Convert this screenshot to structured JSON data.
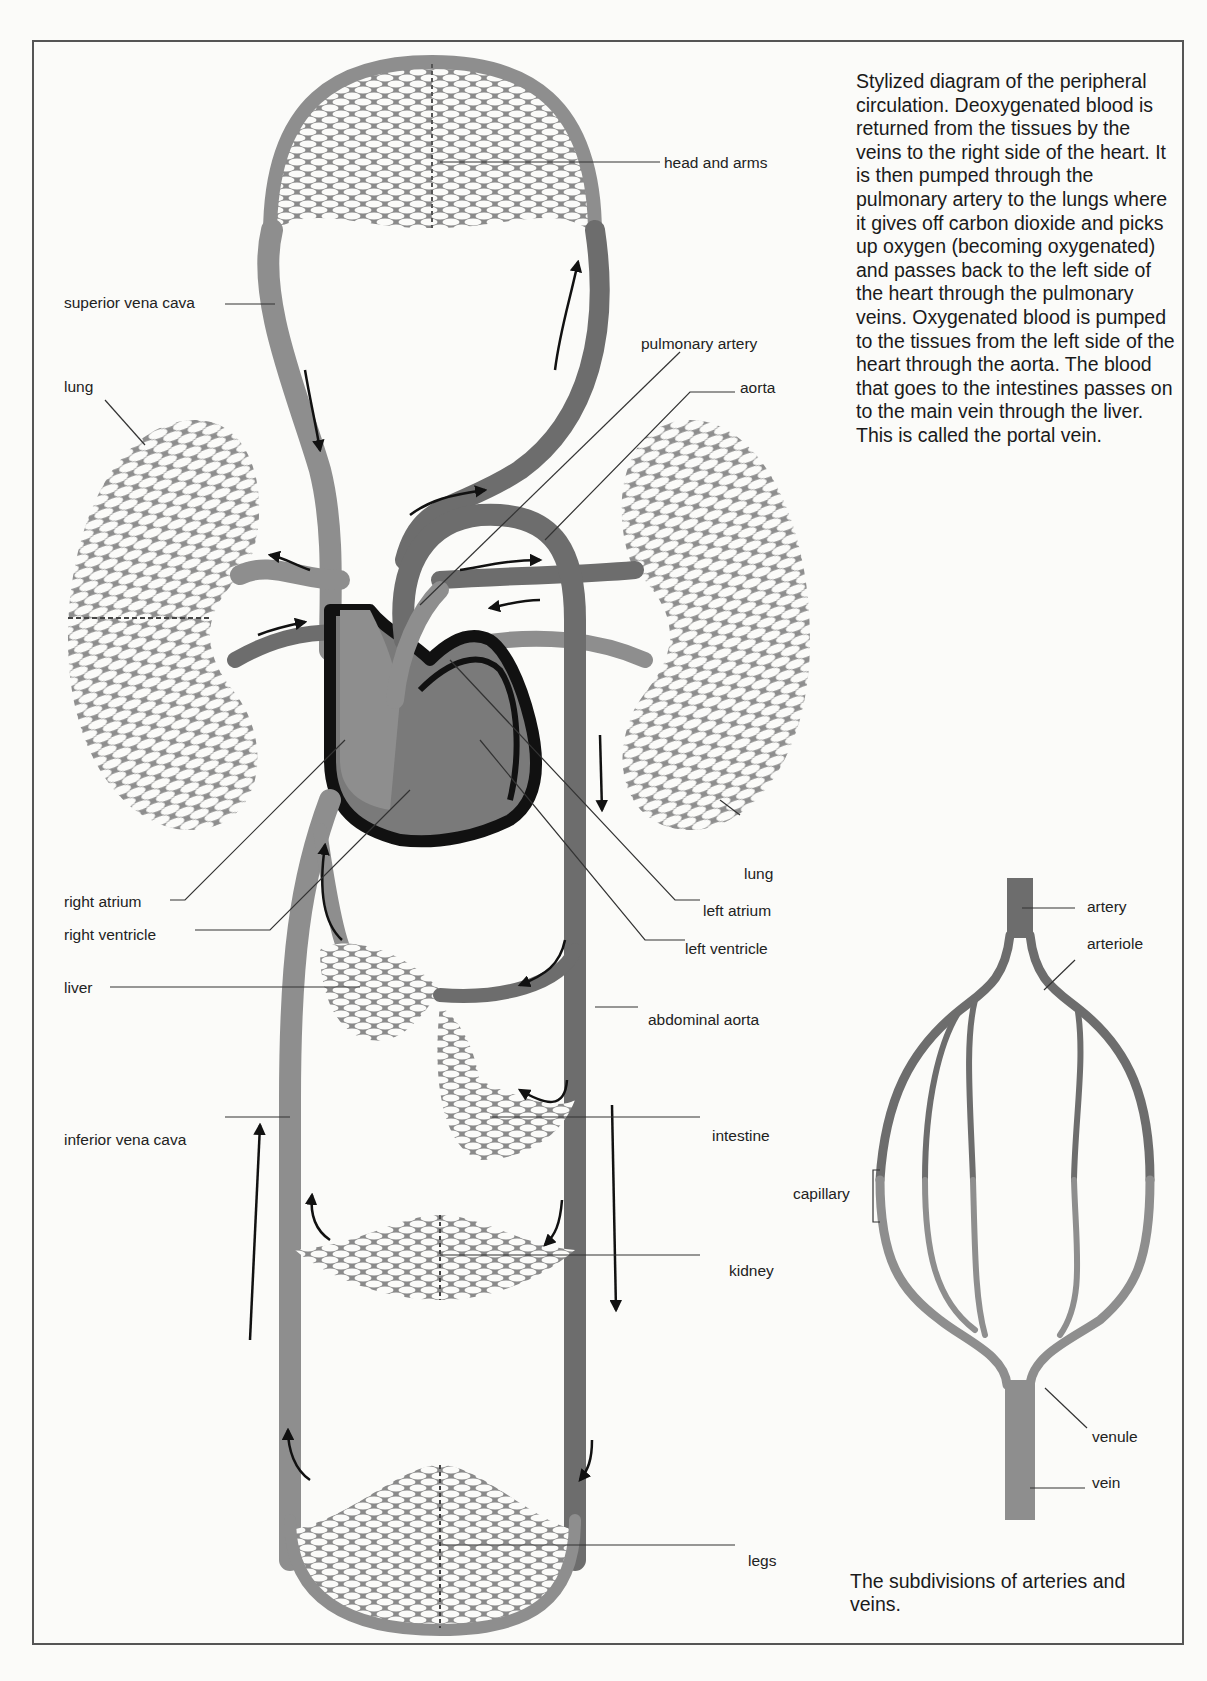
{
  "figure": {
    "title_caption": "Stylized diagram of the peripheral circulation. Deoxygenated blood is returned from the tissues by the veins to the right side of the heart. It is then pumped through the pulmonary artery to the lungs where it gives off carbon dioxide and picks up oxygen (becoming oxygenated) and passes back to the left side of the heart through the pulmonary veins. Oxygenated blood is pumped to the tissues from the left side of the heart through the aorta. The blood that goes to the intestines passes on to the main vein through the liver. This is called the portal vein.",
    "subdivision_caption": "The subdivisions of arteries and veins.",
    "colors": {
      "vein_gray": "#8e8e8e",
      "artery_gray": "#6d6d6d",
      "heart_outline": "#111111",
      "frame": "#555555",
      "background": "#fbfbf9"
    }
  },
  "circulation_labels": {
    "head_and_arms": "head and arms",
    "superior_vena_cava": "superior vena cava",
    "pulmonary_artery": "pulmonary artery",
    "aorta": "aorta",
    "lung_left": "lung",
    "lung_right": "lung",
    "right_atrium": "right atrium",
    "right_ventricle": "right ventricle",
    "left_atrium": "left atrium",
    "left_ventricle": "left ventricle",
    "liver": "liver",
    "abdominal_aorta": "abdominal aorta",
    "intestine": "intestine",
    "inferior_vena_cava": "inferior vena cava",
    "kidney": "kidney",
    "legs": "legs"
  },
  "subdivision_labels": {
    "artery": "artery",
    "arteriole": "arteriole",
    "capillary": "capillary",
    "venule": "venule",
    "vein": "vein"
  }
}
